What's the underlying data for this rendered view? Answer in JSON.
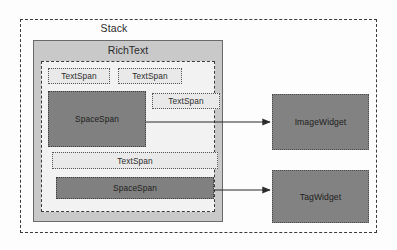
{
  "diagram": {
    "title": "Stack",
    "containers": {
      "stack": {
        "label": "Stack"
      },
      "richtext": {
        "label": "RichText"
      }
    },
    "spans": [
      {
        "id": "text-span-1",
        "label": "TextSpan",
        "kind": "light"
      },
      {
        "id": "text-span-2",
        "label": "TextSpan",
        "kind": "light"
      },
      {
        "id": "space-span-1",
        "label": "SpaceSpan",
        "kind": "dark"
      },
      {
        "id": "text-span-3",
        "label": "TextSpan",
        "kind": "light"
      },
      {
        "id": "text-span-4",
        "label": "TextSpan",
        "kind": "light"
      },
      {
        "id": "space-span-2",
        "label": "SpaceSpan",
        "kind": "dark"
      }
    ],
    "widgets": [
      {
        "id": "image-widget",
        "label": "ImageWidget"
      },
      {
        "id": "tag-widget",
        "label": "TagWidget"
      }
    ],
    "edges": [
      {
        "from": "space-span-1",
        "to": "image-widget"
      },
      {
        "from": "space-span-2",
        "to": "tag-widget"
      }
    ],
    "colors": {
      "dark_fill": "#808080",
      "light_fill": "#e9e9e9",
      "container_fill": "#c9c9c9",
      "inner_fill": "#f2f2f2",
      "stroke": "#3a3a3a"
    }
  }
}
